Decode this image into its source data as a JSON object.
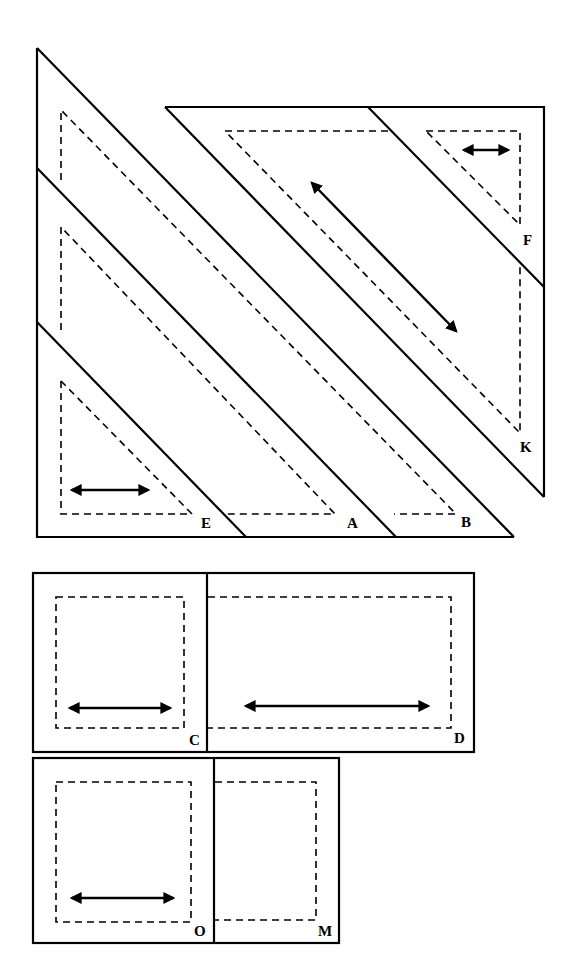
{
  "diagram": {
    "type": "quilt-pattern-pieces",
    "colors": {
      "line": "#000000",
      "background": "#ffffff"
    },
    "pieces": [
      {
        "id": "A",
        "label": "A",
        "shape": "long-triangle-strip",
        "grainline": false
      },
      {
        "id": "B",
        "label": "B",
        "shape": "long-triangle-strip",
        "grainline": false
      },
      {
        "id": "E",
        "label": "E",
        "shape": "right-triangle",
        "grainline": true,
        "grainline_direction": "horizontal"
      },
      {
        "id": "F",
        "label": "F",
        "shape": "right-triangle",
        "grainline": true,
        "grainline_direction": "horizontal"
      },
      {
        "id": "K",
        "label": "K",
        "shape": "trapezoid",
        "grainline": true,
        "grainline_direction": "diagonal"
      },
      {
        "id": "C",
        "label": "C",
        "shape": "square",
        "grainline": true,
        "grainline_direction": "horizontal"
      },
      {
        "id": "D",
        "label": "D",
        "shape": "rectangle",
        "grainline": true,
        "grainline_direction": "horizontal"
      },
      {
        "id": "O",
        "label": "O",
        "shape": "square",
        "grainline": true,
        "grainline_direction": "horizontal"
      },
      {
        "id": "M",
        "label": "M",
        "shape": "rectangle",
        "grainline": false
      }
    ]
  }
}
